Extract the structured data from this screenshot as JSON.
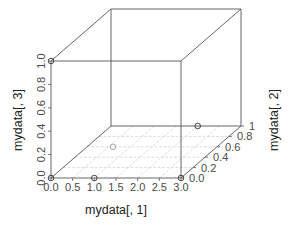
{
  "chart_data": {
    "type": "scatter3d",
    "title": "",
    "xlabel": "mydata[, 1]",
    "ylabel": "mydata[, 2]",
    "zlabel": "mydata[, 3]",
    "x_ticks": [
      "0.0",
      "0.5",
      "1.0",
      "1.5",
      "2.0",
      "2.5",
      "3.0"
    ],
    "y_ticks": [
      "0.0",
      "0.2",
      "0.4",
      "0.6",
      "0.8",
      "1"
    ],
    "z_ticks": [
      "0.0",
      "0.2",
      "0.4",
      "0.6",
      "0.8",
      "1.0"
    ],
    "xlim": [
      0,
      3
    ],
    "ylim": [
      0,
      1
    ],
    "zlim": [
      0,
      1
    ],
    "grid": true,
    "box": true,
    "points": [
      {
        "x": 0,
        "y": 0,
        "z": 0
      },
      {
        "x": 1,
        "y": 0,
        "z": 0
      },
      {
        "x": 3,
        "y": 0,
        "z": 0
      },
      {
        "x": 0,
        "y": 0,
        "z": 1
      },
      {
        "x": 2,
        "y": 1,
        "z": 0
      },
      {
        "x": 0.6,
        "y": 0.6,
        "z": 0
      }
    ]
  },
  "colors": {
    "box": "#555555",
    "grid": "#cfcfcf",
    "point": "#333333",
    "text": "#4a4a4a"
  }
}
